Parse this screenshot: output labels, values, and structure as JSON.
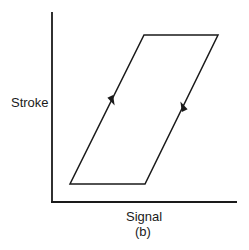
{
  "diagram": {
    "type": "hysteresis-loop",
    "ylabel": "Stroke",
    "xlabel": "Signal",
    "caption": "(b)",
    "line_color": "#1a1a1a",
    "axes": {
      "origin": [
        52,
        202
      ],
      "y_top": [
        52,
        12
      ],
      "x_end": [
        237,
        202
      ]
    },
    "loop_vertices": [
      [
        70,
        184
      ],
      [
        145,
        184
      ],
      [
        218,
        35
      ],
      [
        144,
        35
      ]
    ],
    "arrows": [
      {
        "name": "up-arrow",
        "direction": "up",
        "position": [
          183,
          107
        ],
        "edge": "right"
      },
      {
        "name": "down-arrow",
        "direction": "down",
        "position": [
          112,
          100
        ],
        "edge": "left"
      }
    ]
  }
}
